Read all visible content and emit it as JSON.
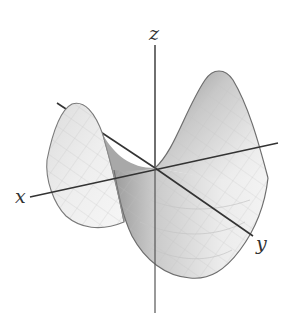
{
  "figure": {
    "surface": {
      "name": "saddle",
      "fill_light": "#f4f4f4",
      "fill_mid": "#d9d9d9",
      "fill_dark": "#9a9a9a",
      "edge_color": "#6e6e6e",
      "mesh_color": "#bdbdbd"
    },
    "axes": {
      "color": "#333333",
      "x": {
        "label": "x"
      },
      "y": {
        "label": "y"
      },
      "z": {
        "label": "z"
      }
    }
  }
}
